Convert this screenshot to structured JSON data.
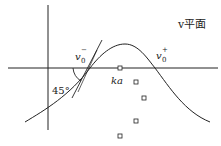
{
  "diagram": {
    "plane_label": "v平面",
    "labels": {
      "v0_minus_base": "v",
      "v0_minus_sub": "0",
      "v0_minus_sup": "−",
      "v0_plus_base": "v",
      "v0_plus_sub": "0",
      "v0_plus_sup": "+",
      "ka": "ka",
      "angle": "45°"
    },
    "markers": [
      {
        "x": 120,
        "y": 68
      },
      {
        "x": 136,
        "y": 82
      },
      {
        "x": 144,
        "y": 98
      },
      {
        "x": 136,
        "y": 121
      },
      {
        "x": 120,
        "y": 136
      }
    ],
    "colors": {
      "stroke": "#222222",
      "background": "#ffffff"
    }
  }
}
